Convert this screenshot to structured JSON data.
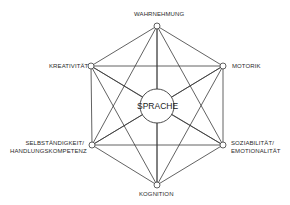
{
  "diagram": {
    "center": {
      "label": "SPRACHE",
      "x": 157,
      "y": 106,
      "r": 17
    },
    "nodes": [
      {
        "id": "wahrnehmung",
        "label": "WAHRNEHMUNG",
        "x": 157,
        "y": 26
      },
      {
        "id": "motorik",
        "label": "MOTORIK",
        "x": 223,
        "y": 66
      },
      {
        "id": "soziabilitaet",
        "label_line1": "SOZIABILITÄT/",
        "label_line2": "EMOTIONALITÄT",
        "x": 223,
        "y": 145
      },
      {
        "id": "kognition",
        "label": "KOGNITION",
        "x": 157,
        "y": 185
      },
      {
        "id": "selbstaendigkeit",
        "label_line1": "SELBSTÄNDIGKEIT/",
        "label_line2": "HANDLUNGSKOMPETENZ",
        "x": 92,
        "y": 145
      },
      {
        "id": "kreativitaet",
        "label": "KREATIVITÄT",
        "x": 91,
        "y": 66
      }
    ],
    "line_color": "#3a3a3a",
    "node_radius": 3
  }
}
